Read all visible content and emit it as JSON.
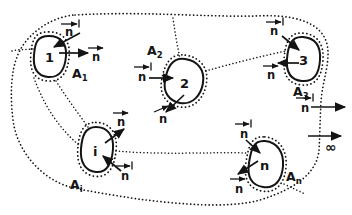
{
  "diagram": {
    "ink_color": "#141414",
    "background_color": "#ffffff",
    "regions": [
      {
        "number": "1",
        "area_label": "A₁",
        "area_main": "A",
        "area_sub": "1"
      },
      {
        "number": "2",
        "area_label": "A₂",
        "area_main": "A",
        "area_sub": "2"
      },
      {
        "number": "3",
        "area_label": "A₃",
        "area_main": "A",
        "area_sub": "3"
      },
      {
        "number": "i",
        "area_label": "Aᵢ",
        "area_main": "A",
        "area_sub": "i"
      },
      {
        "number": "n",
        "area_label": "Aₙ",
        "area_main": "A",
        "area_sub": "n"
      }
    ],
    "normals": [
      {
        "region": "1",
        "direction": "inward",
        "label": "n⃗′",
        "glyph": "n"
      },
      {
        "region": "1",
        "direction": "outward",
        "label": "n⃗",
        "glyph": "n"
      },
      {
        "region": "2",
        "direction": "inward",
        "label": "n⃗′",
        "glyph": "n"
      },
      {
        "region": "2",
        "direction": "outward",
        "label": "n⃗",
        "glyph": "n"
      },
      {
        "region": "3",
        "direction": "inward",
        "label": "n⃗′",
        "glyph": "n"
      },
      {
        "region": "3",
        "direction": "outward",
        "label": "n⃗",
        "glyph": "n"
      },
      {
        "region": "i",
        "direction": "outward",
        "label": "n⃗",
        "glyph": "n"
      },
      {
        "region": "i",
        "direction": "inward",
        "label": "n⃗′",
        "glyph": "n"
      },
      {
        "region": "n",
        "direction": "inward",
        "label": "n⃗′",
        "glyph": "n"
      },
      {
        "region": "n",
        "direction": "outward",
        "label": "n⃗",
        "glyph": "n"
      },
      {
        "region": "outer",
        "direction": "outward",
        "label": "n⃗′",
        "glyph": "n"
      }
    ],
    "outer_boundary": {
      "style": "dotted",
      "infinity_label": "∞"
    }
  }
}
